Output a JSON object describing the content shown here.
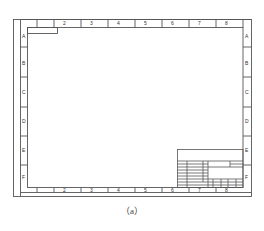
{
  "drawing": {
    "title": "Drawing sheet frame with zone references",
    "column_labels": [
      "1",
      "2",
      "3",
      "4",
      "5",
      "6",
      "7",
      "8"
    ],
    "row_labels": [
      "A",
      "B",
      "C",
      "D",
      "E",
      "F"
    ],
    "line_color": "#555555",
    "caption": "（a）"
  }
}
